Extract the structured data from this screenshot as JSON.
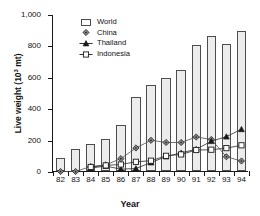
{
  "chart_data": {
    "type": "bar",
    "title": "",
    "xlabel": "Year",
    "ylabel": "Live weight (10³ mt)",
    "ylabel_text": "Live weight (10",
    "ylabel_exp": "3",
    "ylabel_unit": " mt)",
    "ylim": [
      0,
      1000
    ],
    "yticks": [
      0,
      200,
      400,
      600,
      800,
      1000
    ],
    "ytick_labels": [
      "0",
      "200",
      "400",
      "600",
      "800",
      "1,000"
    ],
    "categories": [
      "82",
      "83",
      "84",
      "85",
      "86",
      "87",
      "88",
      "89",
      "90",
      "91",
      "92",
      "93",
      "94"
    ],
    "grid": false,
    "legend_position": "top-center",
    "series": [
      {
        "name": "World",
        "render": "bar",
        "marker": "open-square",
        "color": "#ececec",
        "edge_color": "#4d4d4d",
        "values": [
          85,
          143,
          172,
          203,
          293,
          473,
          550,
          593,
          645,
          800,
          863,
          810,
          893
        ]
      },
      {
        "name": "China",
        "render": "line",
        "marker": "filled-diamond",
        "color": "#555555",
        "values": [
          3,
          3,
          35,
          45,
          85,
          153,
          202,
          188,
          188,
          223,
          207,
          97,
          70
        ]
      },
      {
        "name": "Thailand",
        "render": "line",
        "marker": "filled-triangle",
        "color": "#333333",
        "values": [
          null,
          null,
          25,
          38,
          18,
          22,
          60,
          98,
          122,
          145,
          196,
          225,
          272
        ]
      },
      {
        "name": "Indonesia",
        "render": "line",
        "marker": "open-square",
        "color": "#333333",
        "values": [
          null,
          null,
          32,
          42,
          48,
          65,
          72,
          103,
          112,
          140,
          142,
          152,
          170
        ]
      }
    ]
  },
  "legend": {
    "items": [
      {
        "label": "World",
        "key": "open-bar-key"
      },
      {
        "label": "China",
        "key": "filled-diamond-key"
      },
      {
        "label": "Thailand",
        "key": "filled-triangle-key"
      },
      {
        "label": "Indonesia",
        "key": "open-square-key"
      }
    ]
  }
}
